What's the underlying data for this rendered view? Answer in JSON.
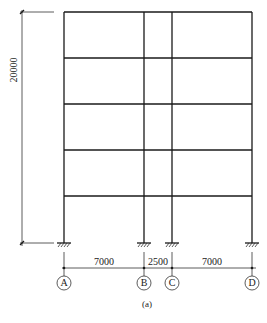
{
  "figure": {
    "caption": "(a)"
  },
  "dimensions": {
    "total_height": "20000",
    "bays": [
      "7000",
      "2500",
      "7000"
    ]
  },
  "axes": [
    "A",
    "B",
    "C",
    "D"
  ],
  "geometry": {
    "column_x": [
      64,
      144,
      172,
      252
    ],
    "floor_y": [
      12,
      58,
      104,
      150,
      196
    ],
    "base_y": 243,
    "storeys": 5
  },
  "colors": {
    "line": "#1a1a1a",
    "background": "#ffffff"
  }
}
